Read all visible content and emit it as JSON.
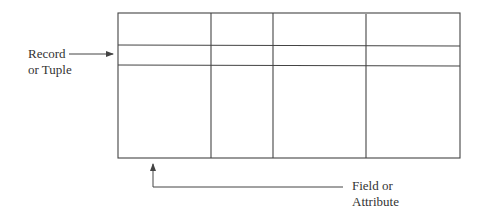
{
  "diagram": {
    "type": "relational-table-structure",
    "table": {
      "columns": 4,
      "rows": 3
    },
    "labels": {
      "record": [
        "Record",
        "or Tuple"
      ],
      "field": [
        "Field or",
        "Attribute"
      ]
    },
    "line_color": "#444444"
  }
}
